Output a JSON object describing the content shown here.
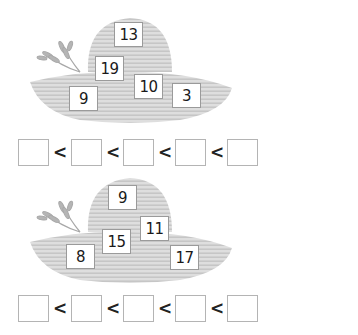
{
  "exercises": [
    {
      "numbers": [
        "13",
        "19",
        "10",
        "9",
        "3"
      ],
      "answer_boxes": [
        "",
        "",
        "",
        "",
        ""
      ],
      "comparison_symbol": "<"
    },
    {
      "numbers": [
        "9",
        "11",
        "15",
        "8",
        "17"
      ],
      "answer_boxes": [
        "",
        "",
        "",
        "",
        ""
      ],
      "comparison_symbol": "<"
    }
  ],
  "colors": {
    "hat_fill": "#d9d9d9",
    "hat_stripe": "#bdbdbd",
    "wheat": "#a8a8a8"
  }
}
